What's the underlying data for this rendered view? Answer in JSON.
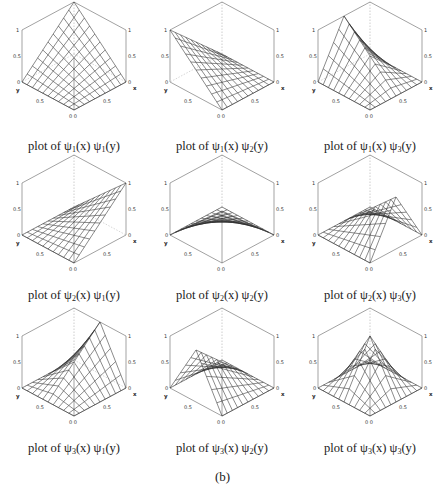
{
  "figure": {
    "label": "(b)",
    "caption_prefix": "plot of ",
    "symbol": "ψ",
    "colors": {
      "mesh": "#2a2a2a",
      "box": "#444444",
      "hidden": "#9a9a9a",
      "text": "#1a1a1a"
    }
  },
  "chart_data": [
    {
      "type": "surface",
      "title": "plot of ψ1(x) ψ1(y)",
      "i": 1,
      "j": 1,
      "xlabel": "x",
      "ylabel": "y",
      "zlim": [
        0,
        1
      ],
      "ticks": [
        "0",
        "0.5",
        "1"
      ],
      "grid": 11,
      "description": "bilinear corner function peaking at 1 at (0,0), zero elsewhere on far edges"
    },
    {
      "type": "surface",
      "title": "plot of ψ1(x) ψ2(y)",
      "i": 1,
      "j": 2,
      "xlabel": "x",
      "ylabel": "y",
      "zlim": [
        0,
        1
      ],
      "ticks": [
        "0",
        "0.5",
        "1"
      ],
      "grid": 11
    },
    {
      "type": "surface",
      "title": "plot of ψ1(x) ψ3(y)",
      "i": 1,
      "j": 3,
      "xlabel": "x",
      "ylabel": "y",
      "zlim": [
        0,
        1
      ],
      "ticks": [
        "0",
        "0.5",
        "1"
      ],
      "grid": 11
    },
    {
      "type": "surface",
      "title": "plot of ψ2(x) ψ1(y)",
      "i": 2,
      "j": 1,
      "xlabel": "x",
      "ylabel": "y",
      "zlim": [
        0,
        1
      ],
      "ticks": [
        "0",
        "0.5",
        "1"
      ],
      "grid": 11
    },
    {
      "type": "surface",
      "title": "plot of ψ2(x) ψ2(y)",
      "i": 2,
      "j": 2,
      "xlabel": "x",
      "ylabel": "y",
      "zlim": [
        0,
        1
      ],
      "ticks": [
        "0",
        "0.5",
        "1"
      ],
      "grid": 11
    },
    {
      "type": "surface",
      "title": "plot of ψ2(x) ψ3(y)",
      "i": 2,
      "j": 3,
      "xlabel": "x",
      "ylabel": "y",
      "zlim": [
        0,
        1
      ],
      "ticks": [
        "0",
        "0.5",
        "1"
      ],
      "grid": 11
    },
    {
      "type": "surface",
      "title": "plot of ψ3(x) ψ1(y)",
      "i": 3,
      "j": 1,
      "xlabel": "x",
      "ylabel": "y",
      "zlim": [
        0,
        1
      ],
      "ticks": [
        "0",
        "0.5",
        "1"
      ],
      "grid": 11
    },
    {
      "type": "surface",
      "title": "plot of ψ3(x) ψ2(y)",
      "i": 3,
      "j": 2,
      "xlabel": "x",
      "ylabel": "y",
      "zlim": [
        0,
        1
      ],
      "ticks": [
        "0",
        "0.5",
        "1"
      ],
      "grid": 11
    },
    {
      "type": "surface",
      "title": "plot of ψ3(x) ψ3(y)",
      "i": 3,
      "j": 3,
      "xlabel": "x",
      "ylabel": "y",
      "zlim": [
        0,
        1
      ],
      "ticks": [
        "0",
        "0.5",
        "1"
      ],
      "grid": 11
    }
  ],
  "basis_definitions": {
    "psi1": "1 - t (linear, 1 at 0)",
    "psi2": "t (linear, 1 at 1)",
    "psi3": "hat function peaking at 0.5"
  },
  "panels": [
    {
      "sub1": "1",
      "sub2": "1",
      "left": 0,
      "top": 0,
      "caption_top": 139
    },
    {
      "sub1": "1",
      "sub2": "2",
      "left": 148,
      "top": 0,
      "caption_top": 139
    },
    {
      "sub1": "1",
      "sub2": "3",
      "left": 296,
      "top": 0,
      "caption_top": 139
    },
    {
      "sub1": "2",
      "sub2": "1",
      "left": 0,
      "top": 153,
      "caption_top": 135
    },
    {
      "sub1": "2",
      "sub2": "2",
      "left": 148,
      "top": 153,
      "caption_top": 135
    },
    {
      "sub1": "2",
      "sub2": "3",
      "left": 296,
      "top": 153,
      "caption_top": 135
    },
    {
      "sub1": "3",
      "sub2": "1",
      "left": 0,
      "top": 306,
      "caption_top": 135
    },
    {
      "sub1": "3",
      "sub2": "2",
      "left": 148,
      "top": 306,
      "caption_top": 135
    },
    {
      "sub1": "3",
      "sub2": "3",
      "left": 296,
      "top": 306,
      "caption_top": 135
    }
  ]
}
